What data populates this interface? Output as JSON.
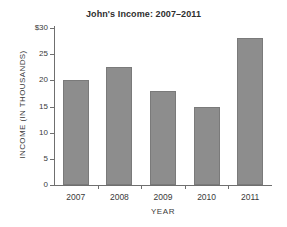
{
  "chart_data": {
    "type": "bar",
    "title": "John's Income: 2007–2011",
    "xlabel": "YEAR",
    "ylabel": "INCOME  (IN THOUSANDS)",
    "categories": [
      "2007",
      "2008",
      "2009",
      "2010",
      "2011"
    ],
    "values": [
      20,
      22.5,
      18,
      15,
      28
    ],
    "ylim": [
      0,
      30
    ],
    "ytick_values": [
      0,
      5,
      10,
      15,
      20,
      25,
      30
    ],
    "ytick_labels": [
      "0",
      "5",
      "10",
      "15",
      "20",
      "25",
      "$30"
    ],
    "grid": false,
    "legend": false,
    "bar_color": "#8d8d8d",
    "bar_border_color": "#7a7a7a",
    "axis_color": "#6f6f6f",
    "background_color": "#ffffff"
  }
}
